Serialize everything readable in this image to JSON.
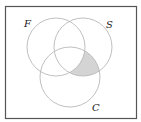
{
  "diagram": {
    "type": "venn",
    "sets": [
      {
        "label": "F",
        "cx": 56,
        "cy": 47,
        "r": 29
      },
      {
        "label": "S",
        "cx": 83,
        "cy": 47,
        "r": 29
      },
      {
        "label": "C",
        "cx": 70,
        "cy": 77,
        "r": 30
      }
    ],
    "shaded_region": "(S ∩ C) − F",
    "colors": {
      "frame": "#555555",
      "circle_stroke": "#b8b8b8",
      "shade_fill": "#d4d4d4"
    }
  }
}
